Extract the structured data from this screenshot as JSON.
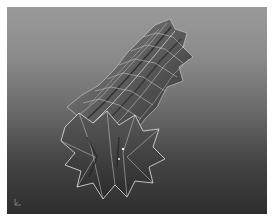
{
  "viewport": {
    "name": "3D modeling perspective viewport",
    "object": "twisted star-profile extruded column mesh",
    "display_mode": "smooth shaded with wireframe",
    "colors": {
      "background_top": "#9a9a9a",
      "background_bottom": "#2e2e2e",
      "mesh_fill_light": "#7a7a7a",
      "mesh_fill_dark": "#3a3a3a",
      "wire": "#d8d8d8"
    }
  },
  "axis_gizmo": {
    "icon": "axis-orientation-icon",
    "labels": [
      "",
      ""
    ]
  }
}
